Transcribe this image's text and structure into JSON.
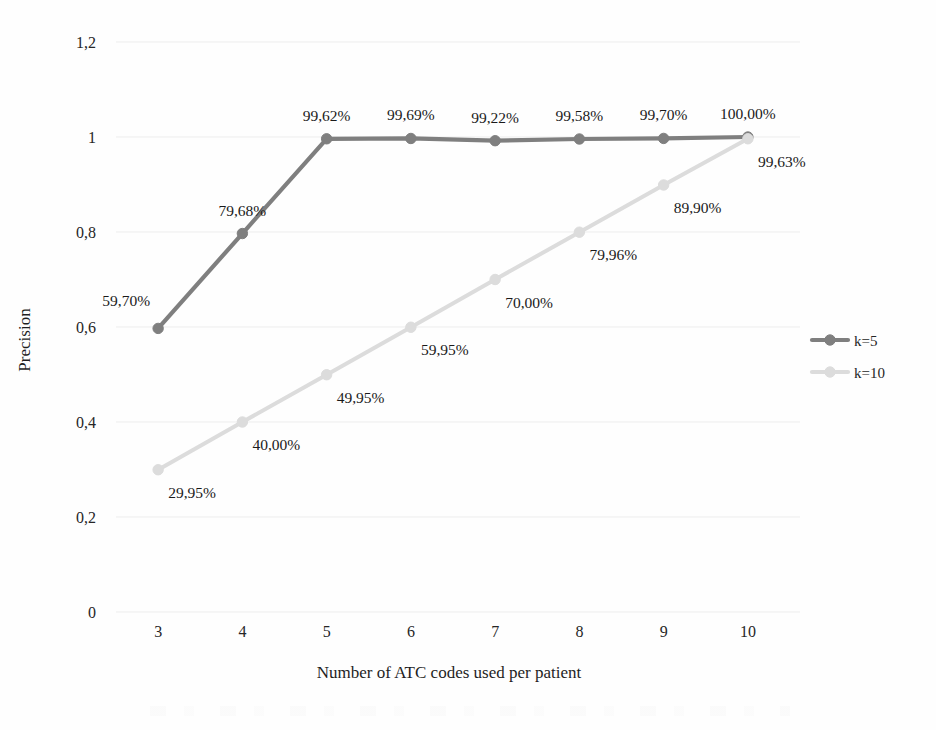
{
  "chart_data": {
    "type": "line",
    "title": "",
    "xlabel": "Number of ATC codes used per patient",
    "ylabel": "Precision",
    "x": [
      3,
      4,
      5,
      6,
      7,
      8,
      9,
      10
    ],
    "xtick_labels": [
      "3",
      "4",
      "5",
      "6",
      "7",
      "8",
      "9",
      "10"
    ],
    "ylim": [
      0,
      1.2
    ],
    "ytick_values": [
      0,
      0.2,
      0.4,
      0.6,
      0.8,
      1,
      1.2
    ],
    "ytick_labels": [
      "0",
      "0,2",
      "0,4",
      "0,6",
      "0,8",
      "1",
      "1,2"
    ],
    "grid": true,
    "grid_axis": "y",
    "legend_position": "right",
    "series": [
      {
        "name": "k=5",
        "color": "#7f7f7f",
        "marker": "circle",
        "values": [
          0.597,
          0.7968,
          0.9962,
          0.9969,
          0.9922,
          0.9958,
          0.997,
          1.0
        ],
        "labels": [
          "59,70%",
          "79,68%",
          "99,62%",
          "99,69%",
          "99,22%",
          "99,58%",
          "99,70%",
          "100,00%"
        ],
        "label_positions": [
          "below-left",
          "above",
          "above",
          "above",
          "above",
          "above",
          "above",
          "above"
        ]
      },
      {
        "name": "k=10",
        "color": "#dcdcdc",
        "marker": "circle",
        "values": [
          0.2995,
          0.4,
          0.4995,
          0.5995,
          0.7,
          0.7996,
          0.899,
          0.9963
        ],
        "labels": [
          "29,95%",
          "40,00%",
          "49,95%",
          "59,95%",
          "70,00%",
          "79,96%",
          "89,90%",
          "99,63%"
        ],
        "label_positions": [
          "below-right",
          "below-right",
          "below-right",
          "below-right",
          "below-right",
          "below-right",
          "below-right",
          "below-right"
        ]
      }
    ]
  },
  "legend": {
    "items": [
      {
        "label": "k=5",
        "color": "#7f7f7f"
      },
      {
        "label": "k=10",
        "color": "#dcdcdc"
      }
    ]
  },
  "axes": {
    "y_title": "Precision",
    "x_title": "Number of ATC codes used per patient"
  }
}
